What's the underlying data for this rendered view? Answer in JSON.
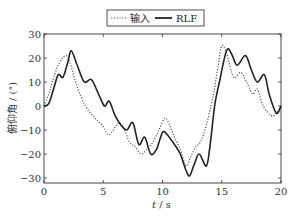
{
  "chart_data": {
    "type": "line",
    "title": "",
    "xlabel": "t / s",
    "ylabel": "俯仰角 / (°)",
    "xlim": [
      0,
      20
    ],
    "ylim": [
      -33,
      30
    ],
    "xticks": [
      0,
      5,
      10,
      15,
      20
    ],
    "yticks": [
      -30,
      -20,
      -10,
      0,
      10,
      20,
      30
    ],
    "grid": false,
    "legend_position": "top-center-outside",
    "series": [
      {
        "name": "输入",
        "style": "dotted",
        "color": "#555555",
        "x": [
          0,
          0.4,
          0.7,
          1.2,
          1.8,
          2.2,
          2.8,
          3.5,
          4.3,
          4.9,
          5.5,
          6.3,
          6.8,
          7.2,
          7.7,
          8.2,
          8.7,
          9.2,
          9.7,
          10.2,
          10.6,
          11.0,
          11.5,
          12.0,
          12.4,
          12.8,
          13.2,
          13.7,
          14.3,
          14.7,
          15.0,
          15.4,
          16.0,
          16.6,
          17.1,
          17.6,
          18.0,
          18.5,
          19.2,
          19.6,
          20
        ],
        "y": [
          0,
          5,
          10,
          17,
          21,
          18,
          8,
          0,
          -5,
          -8,
          -12,
          -7,
          -10,
          -15,
          -17,
          -20,
          -18,
          -15,
          -10,
          -5,
          -8,
          -13,
          -18,
          -25,
          -21,
          -17,
          -15,
          -8,
          5,
          17,
          25,
          22,
          12,
          14,
          10,
          5,
          7,
          0,
          -4,
          -3,
          0
        ]
      },
      {
        "name": "RLF",
        "style": "solid",
        "color": "#222222",
        "x": [
          0,
          0.4,
          0.8,
          1.2,
          1.6,
          2.0,
          2.3,
          2.8,
          3.4,
          4.0,
          4.6,
          5.1,
          5.5,
          6.0,
          6.5,
          7.0,
          7.5,
          8.0,
          8.5,
          9.0,
          9.5,
          10.0,
          10.4,
          11.0,
          11.5,
          12.0,
          12.3,
          12.7,
          13.1,
          13.7,
          14.0,
          14.4,
          14.8,
          15.4,
          15.8,
          16.3,
          17.0,
          17.5,
          18.0,
          18.6,
          19.0,
          19.6,
          20
        ],
        "y": [
          0,
          1,
          7,
          13,
          12,
          18,
          23,
          17,
          10,
          11,
          5,
          0,
          2,
          -4,
          -8,
          -10,
          -7,
          -16,
          -13,
          -20,
          -18,
          -11,
          -12,
          -16,
          -20,
          -27,
          -29,
          -24,
          -20,
          -25,
          -17,
          0,
          10,
          23,
          22,
          17,
          21,
          15,
          10,
          13,
          5,
          -3,
          0
        ]
      }
    ]
  },
  "legend": {
    "items": [
      {
        "label": "输入",
        "style": "dotted"
      },
      {
        "label": "RLF",
        "style": "solid"
      }
    ]
  },
  "axes": {
    "x_label_italic": "t",
    "x_label_unit": " / s",
    "y_label": "俯仰角 / (°)"
  }
}
